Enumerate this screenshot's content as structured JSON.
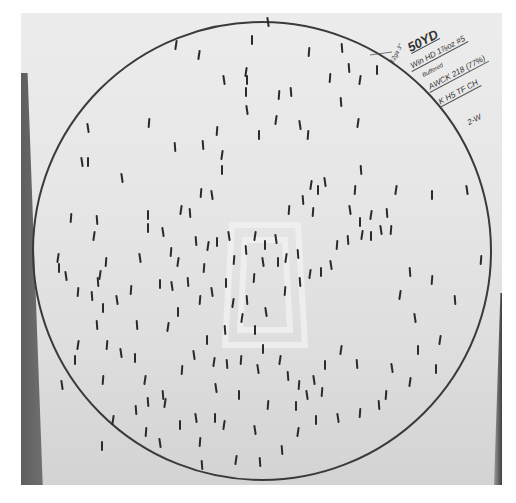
{
  "circle": {
    "cx": 262,
    "cy": 251,
    "r": 229,
    "stroke": "#3a3a3a"
  },
  "colors": {
    "paper": "#e8e8e8",
    "pellet": "#2b2b2b",
    "ink": "#333333"
  },
  "annotations": {
    "distance": "50YD",
    "load": "Win HD 1⅞oz #5",
    "load_sub": "Buffered",
    "count": "AWCK 218 (77%)",
    "choke": "K H5 TF CH",
    "shot_id": "2-W",
    "margin_note": "12ga 3\""
  },
  "pellets": [
    [
      176,
      45
    ],
    [
      252,
      40
    ],
    [
      268,
      22
    ],
    [
      309,
      52
    ],
    [
      342,
      48
    ],
    [
      199,
      55
    ],
    [
      247,
      80
    ],
    [
      224,
      80
    ],
    [
      330,
      78
    ],
    [
      349,
      68
    ],
    [
      360,
      80
    ],
    [
      377,
      70
    ],
    [
      88,
      128
    ],
    [
      149,
      123
    ],
    [
      175,
      147
    ],
    [
      246,
      72
    ],
    [
      246,
      92
    ],
    [
      247,
      110
    ],
    [
      279,
      95
    ],
    [
      291,
      92
    ],
    [
      276,
      120
    ],
    [
      259,
      135
    ],
    [
      300,
      125
    ],
    [
      308,
      135
    ],
    [
      341,
      102
    ],
    [
      358,
      123
    ],
    [
      88,
      162
    ],
    [
      82,
      162
    ],
    [
      217,
      131
    ],
    [
      203,
      145
    ],
    [
      222,
      155
    ],
    [
      222,
      170
    ],
    [
      212,
      195
    ],
    [
      201,
      193
    ],
    [
      190,
      213
    ],
    [
      181,
      210
    ],
    [
      148,
      215
    ],
    [
      122,
      178
    ],
    [
      71,
      218
    ],
    [
      97,
      220
    ],
    [
      94,
      236
    ],
    [
      148,
      228
    ],
    [
      163,
      232
    ],
    [
      171,
      252
    ],
    [
      196,
      241
    ],
    [
      208,
      246
    ],
    [
      217,
      242
    ],
    [
      229,
      236
    ],
    [
      234,
      260
    ],
    [
      246,
      250
    ],
    [
      255,
      236
    ],
    [
      265,
      245
    ],
    [
      276,
      239
    ],
    [
      289,
      210
    ],
    [
      303,
      200
    ],
    [
      311,
      185
    ],
    [
      318,
      190
    ],
    [
      325,
      182
    ],
    [
      313,
      212
    ],
    [
      298,
      254
    ],
    [
      286,
      258
    ],
    [
      278,
      262
    ],
    [
      263,
      262
    ],
    [
      254,
      278
    ],
    [
      247,
      300
    ],
    [
      233,
      303
    ],
    [
      226,
      283
    ],
    [
      212,
      292
    ],
    [
      204,
      268
    ],
    [
      188,
      282
    ],
    [
      178,
      262
    ],
    [
      160,
      284
    ],
    [
      140,
      258
    ],
    [
      106,
      262
    ],
    [
      98,
      282
    ],
    [
      58,
      258
    ],
    [
      59,
      268
    ],
    [
      66,
      276
    ],
    [
      78,
      292
    ],
    [
      92,
      296
    ],
    [
      100,
      275
    ],
    [
      103,
      308
    ],
    [
      117,
      300
    ],
    [
      131,
      290
    ],
    [
      137,
      325
    ],
    [
      168,
      327
    ],
    [
      178,
      312
    ],
    [
      172,
      286
    ],
    [
      200,
      300
    ],
    [
      225,
      330
    ],
    [
      242,
      318
    ],
    [
      255,
      330
    ],
    [
      266,
      312
    ],
    [
      285,
      291
    ],
    [
      300,
      282
    ],
    [
      310,
      274
    ],
    [
      321,
      272
    ],
    [
      331,
      265
    ],
    [
      337,
      245
    ],
    [
      348,
      240
    ],
    [
      362,
      235
    ],
    [
      371,
      236
    ],
    [
      381,
      230
    ],
    [
      391,
      230
    ],
    [
      387,
      213
    ],
    [
      371,
      215
    ],
    [
      360,
      222
    ],
    [
      350,
      210
    ],
    [
      355,
      190
    ],
    [
      361,
      170
    ],
    [
      396,
      190
    ],
    [
      432,
      195
    ],
    [
      467,
      190
    ],
    [
      481,
      260
    ],
    [
      455,
      300
    ],
    [
      440,
      340
    ],
    [
      436,
      369
    ],
    [
      392,
      368
    ],
    [
      386,
      395
    ],
    [
      357,
      364
    ],
    [
      341,
      350
    ],
    [
      325,
      365
    ],
    [
      314,
      380
    ],
    [
      299,
      385
    ],
    [
      288,
      376
    ],
    [
      280,
      360
    ],
    [
      263,
      349
    ],
    [
      258,
      369
    ],
    [
      241,
      360
    ],
    [
      227,
      364
    ],
    [
      214,
      362
    ],
    [
      207,
      340
    ],
    [
      194,
      355
    ],
    [
      182,
      370
    ],
    [
      163,
      395
    ],
    [
      145,
      380
    ],
    [
      135,
      358
    ],
    [
      121,
      353
    ],
    [
      107,
      345
    ],
    [
      97,
      325
    ],
    [
      78,
      345
    ],
    [
      75,
      360
    ],
    [
      62,
      385
    ],
    [
      103,
      380
    ],
    [
      148,
      402
    ],
    [
      165,
      403
    ],
    [
      180,
      425
    ],
    [
      196,
      418
    ],
    [
      200,
      442
    ],
    [
      202,
      465
    ],
    [
      224,
      425
    ],
    [
      239,
      395
    ],
    [
      255,
      430
    ],
    [
      268,
      405
    ],
    [
      282,
      450
    ],
    [
      298,
      432
    ],
    [
      316,
      420
    ],
    [
      338,
      418
    ],
    [
      360,
      413
    ],
    [
      379,
      405
    ],
    [
      410,
      382
    ],
    [
      418,
      350
    ],
    [
      415,
      318
    ],
    [
      432,
      280
    ],
    [
      410,
      272
    ],
    [
      400,
      295
    ],
    [
      296,
      406
    ],
    [
      307,
      395
    ],
    [
      322,
      392
    ],
    [
      260,
      462
    ],
    [
      236,
      460
    ],
    [
      215,
      418
    ],
    [
      160,
      443
    ],
    [
      146,
      432
    ],
    [
      136,
      410
    ],
    [
      113,
      420
    ],
    [
      102,
      446
    ],
    [
      216,
      388
    ]
  ]
}
